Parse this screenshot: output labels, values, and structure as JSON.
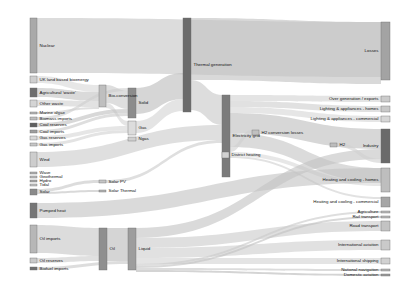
{
  "chart_data": {
    "type": "sankey",
    "title": "",
    "units": "TWh",
    "nodes": [
      {
        "id": "nuclear",
        "label": "Nuclear",
        "x": 30,
        "y": 18,
        "w": 7,
        "h": 55,
        "color": "#a9a9a9"
      },
      {
        "id": "uk_land",
        "label": "UK land based bioenergy",
        "x": 30,
        "y": 76,
        "w": 7,
        "h": 7,
        "color": "#cfcfcf"
      },
      {
        "id": "agri_waste",
        "label": "Agricultural 'waste'",
        "x": 30,
        "y": 88,
        "w": 7,
        "h": 9,
        "color": "#6e6e6e"
      },
      {
        "id": "other_waste",
        "label": "Other waste",
        "x": 30,
        "y": 100,
        "w": 7,
        "h": 7,
        "color": "#d4d4d4"
      },
      {
        "id": "marine_algae",
        "label": "Marine algae",
        "x": 30,
        "y": 112,
        "w": 7,
        "h": 2,
        "color": "#b5b5b5"
      },
      {
        "id": "biomass_imports",
        "label": "Biomass imports",
        "x": 30,
        "y": 117,
        "w": 7,
        "h": 3,
        "color": "#bdbdbd"
      },
      {
        "id": "coal_reserves",
        "label": "Coal reserves",
        "x": 30,
        "y": 123,
        "w": 7,
        "h": 4,
        "color": "#5f5f5f"
      },
      {
        "id": "coal_imports",
        "label": "Coal imports",
        "x": 30,
        "y": 130,
        "w": 7,
        "h": 3,
        "color": "#9e9e9e"
      },
      {
        "id": "gas_reserves",
        "label": "Gas reserves",
        "x": 30,
        "y": 136,
        "w": 7,
        "h": 4,
        "color": "#d8d8d8"
      },
      {
        "id": "gas_imports",
        "label": "Gas imports",
        "x": 30,
        "y": 143,
        "w": 7,
        "h": 3,
        "color": "#c6c6c6"
      },
      {
        "id": "wind",
        "label": "Wind",
        "x": 30,
        "y": 152,
        "w": 7,
        "h": 15,
        "color": "#cdcdcd"
      },
      {
        "id": "wave",
        "label": "Wave",
        "x": 30,
        "y": 172,
        "w": 7,
        "h": 2,
        "color": "#b0b0b0"
      },
      {
        "id": "geothermal",
        "label": "Geothermal",
        "x": 30,
        "y": 176,
        "w": 7,
        "h": 2,
        "color": "#bbbbbb"
      },
      {
        "id": "hydro",
        "label": "Hydro",
        "x": 30,
        "y": 180,
        "w": 7,
        "h": 2,
        "color": "#a8a8a8"
      },
      {
        "id": "tidal",
        "label": "Tidal",
        "x": 30,
        "y": 184,
        "w": 7,
        "h": 2,
        "color": "#c2c2c2"
      },
      {
        "id": "solar",
        "label": "Solar",
        "x": 30,
        "y": 189,
        "w": 7,
        "h": 6,
        "color": "#8a8a8a"
      },
      {
        "id": "pumped_heat",
        "label": "Pumped heat",
        "x": 30,
        "y": 203,
        "w": 7,
        "h": 15,
        "color": "#767676"
      },
      {
        "id": "oil_imports",
        "label": "Oil imports",
        "x": 30,
        "y": 225,
        "w": 7,
        "h": 28,
        "color": "#b7b7b7"
      },
      {
        "id": "oil_reserves",
        "label": "Oil reserves",
        "x": 30,
        "y": 258,
        "w": 7,
        "h": 5,
        "color": "#c9c9c9"
      },
      {
        "id": "biofuel_imports",
        "label": "Biofuel imports",
        "x": 30,
        "y": 267,
        "w": 7,
        "h": 3,
        "color": "#707070"
      },
      {
        "id": "bio_conversion",
        "label": "Bio-conversion",
        "x": 99,
        "y": 85,
        "w": 7,
        "h": 22,
        "color": "#bfbfbf"
      },
      {
        "id": "solar_pv",
        "label": "Solar PV",
        "x": 99,
        "y": 180,
        "w": 7,
        "h": 3,
        "color": "#c4c4c4"
      },
      {
        "id": "solar_thermal",
        "label": "Solar Thermal",
        "x": 99,
        "y": 190,
        "w": 7,
        "h": 2,
        "color": "#b3b3b3"
      },
      {
        "id": "solid",
        "label": "Solid",
        "x": 128,
        "y": 88,
        "w": 8,
        "h": 30,
        "color": "#8c8c8c"
      },
      {
        "id": "gas",
        "label": "Gas",
        "x": 128,
        "y": 121,
        "w": 8,
        "h": 14,
        "color": "#dcdcdc"
      },
      {
        "id": "ngas",
        "label": "Ngas",
        "x": 128,
        "y": 137,
        "w": 8,
        "h": 4,
        "color": "#d0d0d0"
      },
      {
        "id": "liquid",
        "label": "Liquid",
        "x": 128,
        "y": 228,
        "w": 8,
        "h": 42,
        "color": "#9d9d9d"
      },
      {
        "id": "oil",
        "label": "Oil",
        "x": 99,
        "y": 228,
        "w": 8,
        "h": 42,
        "color": "#8f8f8f"
      },
      {
        "id": "thermal_generation",
        "label": "Thermal generation",
        "x": 183,
        "y": 18,
        "w": 8,
        "h": 94,
        "color": "#6b6b6b"
      },
      {
        "id": "electricity_grid",
        "label": "Electricity grid",
        "x": 222,
        "y": 95,
        "w": 8,
        "h": 82,
        "color": "#7b7b7b"
      },
      {
        "id": "district_heating",
        "label": "District heating",
        "x": 222,
        "y": 152,
        "w": 7,
        "h": 6,
        "color": "#d2d2d2"
      },
      {
        "id": "h2_conversion_losses",
        "label": "H2 conversion losses",
        "x": 252,
        "y": 130,
        "w": 7,
        "h": 5,
        "color": "#c0c0c0"
      },
      {
        "id": "h2",
        "label": "H2",
        "x": 330,
        "y": 143,
        "w": 7,
        "h": 4,
        "color": "#bcbcbc"
      },
      {
        "id": "losses",
        "label": "Losses",
        "x": 381,
        "y": 22,
        "w": 9,
        "h": 58,
        "color": "#a3a3a3"
      },
      {
        "id": "over_generation",
        "label": "Over generation / exports",
        "x": 381,
        "y": 96,
        "w": 9,
        "h": 6,
        "color": "#cbcbcb"
      },
      {
        "id": "light_homes",
        "label": "Lighting & appliances - homes",
        "x": 381,
        "y": 106,
        "w": 9,
        "h": 6,
        "color": "#c8c8c8"
      },
      {
        "id": "light_commercial",
        "label": "Lighting & appliances - commercial",
        "x": 381,
        "y": 116,
        "w": 9,
        "h": 6,
        "color": "#d6d6d6"
      },
      {
        "id": "industry",
        "label": "Industry",
        "x": 381,
        "y": 129,
        "w": 9,
        "h": 34,
        "color": "#6a6a6a"
      },
      {
        "id": "heat_homes",
        "label": "Heating and cooling - homes",
        "x": 381,
        "y": 168,
        "w": 9,
        "h": 24,
        "color": "#bebebe"
      },
      {
        "id": "heat_commercial",
        "label": "Heating and cooling - commercial",
        "x": 381,
        "y": 197,
        "w": 9,
        "h": 10,
        "color": "#a6a6a6"
      },
      {
        "id": "agriculture",
        "label": "Agriculture",
        "x": 381,
        "y": 211,
        "w": 9,
        "h": 2,
        "color": "#bababa"
      },
      {
        "id": "rail_transport",
        "label": "Rail transport",
        "x": 381,
        "y": 216,
        "w": 9,
        "h": 2,
        "color": "#b8b8b8"
      },
      {
        "id": "road_transport",
        "label": "Road transport",
        "x": 381,
        "y": 221,
        "w": 9,
        "h": 10,
        "color": "#c3c3c3"
      },
      {
        "id": "intl_aviation",
        "label": "International aviation",
        "x": 381,
        "y": 240,
        "w": 9,
        "h": 10,
        "color": "#cacaca"
      },
      {
        "id": "intl_shipping",
        "label": "International shipping",
        "x": 381,
        "y": 258,
        "w": 9,
        "h": 6,
        "color": "#d1d1d1"
      },
      {
        "id": "national_navigation",
        "label": "National navigation",
        "x": 381,
        "y": 269,
        "w": 9,
        "h": 2,
        "color": "#b4b4b4"
      },
      {
        "id": "domestic_aviation",
        "label": "Domestic aviation",
        "x": 381,
        "y": 274,
        "w": 9,
        "h": 2,
        "color": "#9a9a9a"
      }
    ],
    "links": [
      {
        "source": "nuclear",
        "target": "losses",
        "value": 55,
        "sy": 0,
        "ty": 0,
        "w": 55,
        "color": "#c6c6c6"
      },
      {
        "source": "uk_land",
        "target": "bio_conversion",
        "value": 7,
        "sy": 0,
        "ty": 0,
        "w": 7,
        "color": "#d8d8d8"
      },
      {
        "source": "agri_waste",
        "target": "bio_conversion",
        "value": 9,
        "sy": 0,
        "ty": 7,
        "w": 9,
        "color": "#c4c4c4"
      },
      {
        "source": "other_waste",
        "target": "bio_conversion",
        "value": 7,
        "sy": 0,
        "ty": 16,
        "w": 6,
        "color": "#d0d0d0"
      },
      {
        "source": "marine_algae",
        "target": "bio_conversion",
        "value": 2,
        "sy": 0,
        "ty": 22,
        "w": 2,
        "color": "#cdcdcd"
      },
      {
        "source": "biomass_imports",
        "target": "solid",
        "value": 3,
        "sy": 0,
        "ty": 0,
        "w": 3,
        "color": "#cfcfcf"
      },
      {
        "source": "bio_conversion",
        "target": "solid",
        "value": 18,
        "sy": 0,
        "ty": 3,
        "w": 18,
        "color": "#c9c9c9"
      },
      {
        "source": "bio_conversion",
        "target": "gas",
        "value": 5,
        "sy": 18,
        "ty": 0,
        "w": 5,
        "color": "#d5d5d5"
      },
      {
        "source": "coal_reserves",
        "target": "solid",
        "value": 4,
        "sy": 0,
        "ty": 21,
        "w": 4,
        "color": "#c0c0c0"
      },
      {
        "source": "coal_imports",
        "target": "solid",
        "value": 3,
        "sy": 0,
        "ty": 25,
        "w": 3,
        "color": "#cacaca"
      },
      {
        "source": "gas_reserves",
        "target": "gas",
        "value": 4,
        "sy": 0,
        "ty": 5,
        "w": 4,
        "color": "#d7d7d7"
      },
      {
        "source": "gas_imports",
        "target": "gas",
        "value": 3,
        "sy": 0,
        "ty": 9,
        "w": 3,
        "color": "#d2d2d2"
      },
      {
        "source": "solid",
        "target": "thermal_generation",
        "value": 26,
        "sy": 0,
        "ty": 55,
        "w": 26,
        "color": "#bdbdbd"
      },
      {
        "source": "gas",
        "target": "thermal_generation",
        "value": 12,
        "sy": 0,
        "ty": 81,
        "w": 12,
        "color": "#d4d4d4"
      },
      {
        "source": "thermal_generation",
        "target": "losses",
        "value": 62,
        "sy": 0,
        "ty": 0,
        "w": 62,
        "color": "#c2c2c2"
      },
      {
        "source": "thermal_generation",
        "target": "electricity_grid",
        "value": 30,
        "sy": 62,
        "ty": 0,
        "w": 30,
        "color": "#c8c8c8"
      },
      {
        "source": "wind",
        "target": "electricity_grid",
        "value": 15,
        "sy": 0,
        "ty": 30,
        "w": 15,
        "color": "#cccccc"
      },
      {
        "source": "solar",
        "target": "solar_pv",
        "value": 3,
        "sy": 0,
        "ty": 0,
        "w": 3,
        "color": "#c7c7c7"
      },
      {
        "source": "solar",
        "target": "solar_thermal",
        "value": 2,
        "sy": 3,
        "ty": 0,
        "w": 2,
        "color": "#c1c1c1"
      },
      {
        "source": "solar_pv",
        "target": "electricity_grid",
        "value": 3,
        "sy": 0,
        "ty": 45,
        "w": 3,
        "color": "#cbcbcb"
      },
      {
        "source": "electricity_grid",
        "target": "over_generation",
        "value": 6,
        "sy": 0,
        "ty": 0,
        "w": 6,
        "color": "#d3d3d3"
      },
      {
        "source": "electricity_grid",
        "target": "light_homes",
        "value": 6,
        "sy": 6,
        "ty": 0,
        "w": 6,
        "color": "#cecece"
      },
      {
        "source": "electricity_grid",
        "target": "light_commercial",
        "value": 6,
        "sy": 12,
        "ty": 0,
        "w": 6,
        "color": "#d6d6d6"
      },
      {
        "source": "electricity_grid",
        "target": "industry",
        "value": 20,
        "sy": 18,
        "ty": 0,
        "w": 20,
        "color": "#bfbfbf"
      },
      {
        "source": "electricity_grid",
        "target": "heat_homes",
        "value": 14,
        "sy": 38,
        "ty": 0,
        "w": 14,
        "color": "#c5c5c5"
      },
      {
        "source": "electricity_grid",
        "target": "h2_conversion_losses",
        "value": 5,
        "sy": 52,
        "ty": 0,
        "w": 5,
        "color": "#d0d0d0"
      },
      {
        "source": "district_heating",
        "target": "heat_homes",
        "value": 4,
        "sy": 0,
        "ty": 14,
        "w": 4,
        "color": "#d9d9d9"
      },
      {
        "source": "district_heating",
        "target": "heat_commercial",
        "value": 2,
        "sy": 4,
        "ty": 0,
        "w": 2,
        "color": "#d1d1d1"
      },
      {
        "source": "pumped_heat",
        "target": "heat_homes",
        "value": 15,
        "sy": 0,
        "ty": 0,
        "w": 15,
        "color": "#c3c3c3"
      },
      {
        "source": "oil_imports",
        "target": "oil",
        "value": 28,
        "sy": 0,
        "ty": 0,
        "w": 28,
        "color": "#c6c6c6"
      },
      {
        "source": "oil_reserves",
        "target": "oil",
        "value": 5,
        "sy": 0,
        "ty": 28,
        "w": 5,
        "color": "#cdcdcd"
      },
      {
        "source": "oil",
        "target": "liquid",
        "value": 33,
        "sy": 0,
        "ty": 0,
        "w": 33,
        "color": "#bcbcbc"
      },
      {
        "source": "biofuel_imports",
        "target": "liquid",
        "value": 3,
        "sy": 0,
        "ty": 33,
        "w": 3,
        "color": "#c8c8c8"
      },
      {
        "source": "liquid",
        "target": "industry",
        "value": 10,
        "sy": 0,
        "ty": 20,
        "w": 10,
        "color": "#c4c4c4"
      },
      {
        "source": "liquid",
        "target": "road_transport",
        "value": 10,
        "sy": 10,
        "ty": 0,
        "w": 10,
        "color": "#cbcbcb"
      },
      {
        "source": "liquid",
        "target": "intl_aviation",
        "value": 10,
        "sy": 20,
        "ty": 0,
        "w": 10,
        "color": "#cfcfcf"
      },
      {
        "source": "liquid",
        "target": "intl_shipping",
        "value": 6,
        "sy": 30,
        "ty": 0,
        "w": 6,
        "color": "#d4d4d4"
      },
      {
        "source": "liquid",
        "target": "agriculture",
        "value": 2,
        "sy": 36,
        "ty": 0,
        "w": 2,
        "color": "#c9c9c9"
      },
      {
        "source": "liquid",
        "target": "rail_transport",
        "value": 2,
        "sy": 38,
        "ty": 0,
        "w": 2,
        "color": "#c2c2c2"
      },
      {
        "source": "liquid",
        "target": "national_navigation",
        "value": 2,
        "sy": 40,
        "ty": 0,
        "w": 2,
        "color": "#c7c7c7"
      },
      {
        "source": "liquid",
        "target": "domestic_aviation",
        "value": 2,
        "sy": 42,
        "ty": 0,
        "w": 2,
        "color": "#bababa"
      },
      {
        "source": "h2",
        "target": "industry",
        "value": 4,
        "sy": 0,
        "ty": 30,
        "w": 4,
        "color": "#d0d0d0"
      }
    ]
  },
  "diagram": {
    "background": "#ffffff",
    "link_color": "#cccccc",
    "label_color": "#111111"
  }
}
